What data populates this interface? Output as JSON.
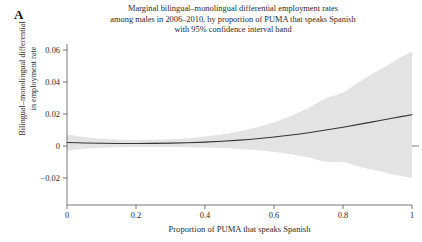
{
  "figure": {
    "panel_label": "A",
    "width": 422,
    "height": 242,
    "background_color": "#ffffff"
  },
  "title": {
    "line1": "Marginal bilingual–monolingual differential employment rates",
    "line2": "among males in 2006–2010, by proportion of PUMA that speaks Spanish",
    "line3": "with 95% confidence interval band"
  },
  "ylabel": {
    "line1": "Bilingual–monolingual differential",
    "line2": "in employment rate"
  },
  "xlabel": "Proportion of PUMA that speaks Spanish",
  "colors": {
    "line": "#333333",
    "band": "#e3e3e3",
    "axis": "#555555",
    "text": "#2b2b2b",
    "background": "#ffffff"
  },
  "chart_data": {
    "type": "line",
    "title": "Marginal bilingual–monolingual differential employment rates among males in 2006–2010, by proportion of PUMA that speaks Spanish with 95% confidence interval band",
    "xlabel": "Proportion of PUMA that speaks Spanish",
    "ylabel": "Bilingual–monolingual differential in employment rate",
    "xlim": [
      0,
      1
    ],
    "ylim": [
      -0.025,
      0.065
    ],
    "xticks": [
      0,
      0.2,
      0.4,
      0.6,
      0.8,
      1
    ],
    "xtick_labels": [
      "0",
      "0.2",
      "0.4",
      "0.6",
      "0.8",
      "1"
    ],
    "yticks": [
      -0.02,
      0,
      0.02,
      0.04,
      0.06
    ],
    "ytick_labels": [
      "−0.02",
      "0",
      "0.02",
      "0.04",
      "0.06"
    ],
    "grid": false,
    "legend": false,
    "zero_reference_line": false,
    "x": [
      0,
      0.05,
      0.1,
      0.15,
      0.2,
      0.25,
      0.3,
      0.35,
      0.4,
      0.45,
      0.5,
      0.55,
      0.6,
      0.65,
      0.7,
      0.75,
      0.8,
      0.85,
      0.9,
      0.95,
      1
    ],
    "series": [
      {
        "name": "Marginal differential employment rate",
        "values": [
          0.0022,
          0.00192,
          0.00172,
          0.0016,
          0.00156,
          0.00162,
          0.00178,
          0.00205,
          0.00245,
          0.003,
          0.0037,
          0.00455,
          0.0056,
          0.00685,
          0.0083,
          0.00995,
          0.01175,
          0.01365,
          0.01565,
          0.01765,
          0.0195
        ]
      }
    ],
    "confidence_band": {
      "level": "95%",
      "upper": [
        0.0072,
        0.0056,
        0.00455,
        0.004,
        0.0038,
        0.0039,
        0.00425,
        0.0049,
        0.0059,
        0.0073,
        0.0092,
        0.0117,
        0.0149,
        0.0189,
        0.0238,
        0.0298,
        0.0335,
        0.0405,
        0.0469,
        0.0532,
        0.059
      ]
    },
    "confidence_band_lower": [
      -0.0028,
      -0.00176,
      -0.00111,
      -0.0008,
      -0.00068,
      -0.00066,
      -0.00069,
      -0.0008,
      -0.001,
      -0.0013,
      -0.0018,
      -0.0026,
      -0.0037,
      -0.0052,
      -0.0072,
      -0.0099,
      -0.01,
      -0.0132,
      -0.0155,
      -0.0179,
      -0.02
    ]
  }
}
